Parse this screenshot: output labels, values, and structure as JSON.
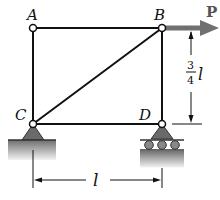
{
  "diagram": {
    "type": "truss-frame",
    "nodes": {
      "A": {
        "label": "A"
      },
      "B": {
        "label": "B"
      },
      "C": {
        "label": "C"
      },
      "D": {
        "label": "D"
      }
    },
    "members": [
      "A-B",
      "A-C",
      "B-D",
      "C-D",
      "C-B"
    ],
    "supports": {
      "C": "pin",
      "D": "roller"
    },
    "load": {
      "label": "P",
      "at": "B",
      "direction": "horizontal-right"
    },
    "dimensions": {
      "height": {
        "numerator": "3",
        "denominator": "4",
        "variable": "l"
      },
      "width": {
        "variable": "l"
      }
    },
    "colors": {
      "line": "#111111",
      "arrow": "#707070",
      "support": "#6a6a6a",
      "ground": "#9a9a9a"
    }
  }
}
